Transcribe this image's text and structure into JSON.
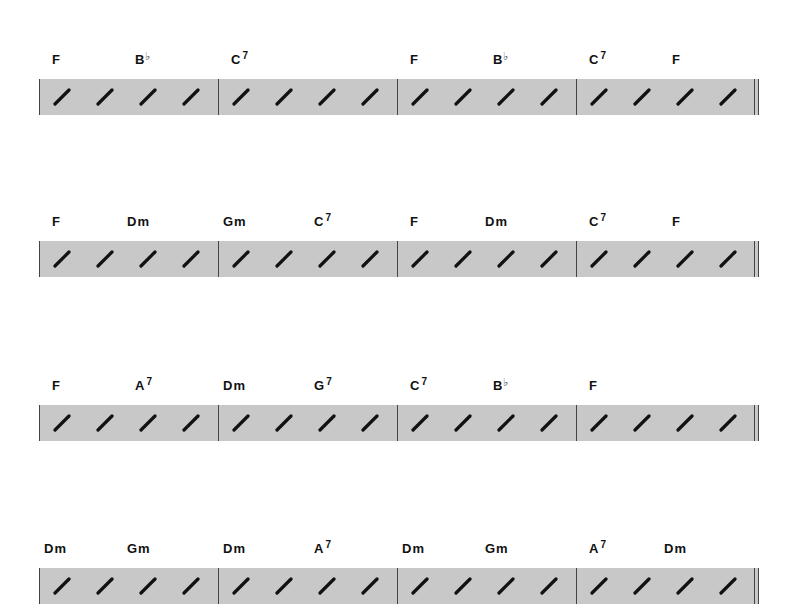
{
  "chart": {
    "type": "chord-chart",
    "time_signature_beats": 4,
    "systems": [
      {
        "measures": [
          {
            "chords": [
              {
                "root": "F",
                "quality": "",
                "accidental": "",
                "beat": 1
              },
              {
                "root": "B",
                "quality": "",
                "accidental": "♭",
                "beat": 3
              }
            ]
          },
          {
            "chords": [
              {
                "root": "C",
                "quality": "7",
                "accidental": "",
                "beat": 1
              }
            ]
          },
          {
            "chords": [
              {
                "root": "F",
                "quality": "",
                "accidental": "",
                "beat": 1
              },
              {
                "root": "B",
                "quality": "",
                "accidental": "♭",
                "beat": 3
              }
            ]
          },
          {
            "chords": [
              {
                "root": "C",
                "quality": "7",
                "accidental": "",
                "beat": 1
              },
              {
                "root": "F",
                "quality": "",
                "accidental": "",
                "beat": 3
              }
            ]
          }
        ]
      },
      {
        "measures": [
          {
            "chords": [
              {
                "root": "F",
                "quality": "",
                "accidental": "",
                "beat": 1
              },
              {
                "root": "Dm",
                "quality": "",
                "accidental": "",
                "beat": 3
              }
            ]
          },
          {
            "chords": [
              {
                "root": "Gm",
                "quality": "",
                "accidental": "",
                "beat": 1
              },
              {
                "root": "C",
                "quality": "7",
                "accidental": "",
                "beat": 3
              }
            ]
          },
          {
            "chords": [
              {
                "root": "F",
                "quality": "",
                "accidental": "",
                "beat": 1
              },
              {
                "root": "Dm",
                "quality": "",
                "accidental": "",
                "beat": 3
              }
            ]
          },
          {
            "chords": [
              {
                "root": "C",
                "quality": "7",
                "accidental": "",
                "beat": 1
              },
              {
                "root": "F",
                "quality": "",
                "accidental": "",
                "beat": 3
              }
            ]
          }
        ]
      },
      {
        "measures": [
          {
            "chords": [
              {
                "root": "F",
                "quality": "",
                "accidental": "",
                "beat": 1
              },
              {
                "root": "A",
                "quality": "7",
                "accidental": "",
                "beat": 3
              }
            ]
          },
          {
            "chords": [
              {
                "root": "Dm",
                "quality": "",
                "accidental": "",
                "beat": 1
              },
              {
                "root": "G",
                "quality": "7",
                "accidental": "",
                "beat": 3
              }
            ]
          },
          {
            "chords": [
              {
                "root": "C",
                "quality": "7",
                "accidental": "",
                "beat": 1
              },
              {
                "root": "B",
                "quality": "",
                "accidental": "♭",
                "beat": 3
              }
            ]
          },
          {
            "chords": [
              {
                "root": "F",
                "quality": "",
                "accidental": "",
                "beat": 1
              }
            ]
          }
        ]
      },
      {
        "measures": [
          {
            "chords": [
              {
                "root": "Dm",
                "quality": "",
                "accidental": "",
                "beat": 1
              },
              {
                "root": "Gm",
                "quality": "",
                "accidental": "",
                "beat": 3
              }
            ]
          },
          {
            "chords": [
              {
                "root": "Dm",
                "quality": "",
                "accidental": "",
                "beat": 1
              },
              {
                "root": "A",
                "quality": "7",
                "accidental": "",
                "beat": 3
              }
            ]
          },
          {
            "chords": [
              {
                "root": "Dm",
                "quality": "",
                "accidental": "",
                "beat": 1
              },
              {
                "root": "Gm",
                "quality": "",
                "accidental": "",
                "beat": 3
              }
            ]
          },
          {
            "chords": [
              {
                "root": "A",
                "quality": "7",
                "accidental": "",
                "beat": 1
              },
              {
                "root": "Dm",
                "quality": "",
                "accidental": "",
                "beat": 3
              }
            ]
          }
        ]
      }
    ],
    "colors": {
      "staff_fill": "#c8c8c8",
      "barline": "#444444",
      "slash": "#111111",
      "chord_text": "#111111"
    }
  }
}
